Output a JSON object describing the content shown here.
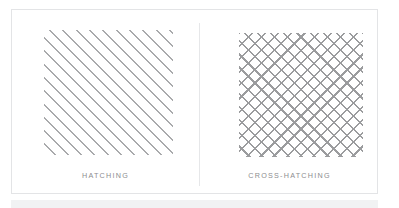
{
  "figure": {
    "background_color": "#ffffff",
    "card": {
      "border_color": "#e3e4e6",
      "divider_color": "#e6e7e9"
    },
    "caption_color": "#8c8d8f",
    "bottom_band_color": "#f1f2f3"
  },
  "panels": [
    {
      "id": "hatching",
      "caption": "HATCHING",
      "swatch_name": "hatching-pattern",
      "line_color": "#a9aaac",
      "line_angle_deg": 45,
      "line_spacing_px": 9,
      "line_width_px": 1.4,
      "directions": 1
    },
    {
      "id": "cross-hatching",
      "caption": "CROSS-HATCHING",
      "swatch_name": "cross-hatching-pattern",
      "line_color": "#9b9c9e",
      "line_angle_deg": 45,
      "line_spacing_px": 9,
      "line_width_px": 1.6,
      "directions": 2
    }
  ]
}
